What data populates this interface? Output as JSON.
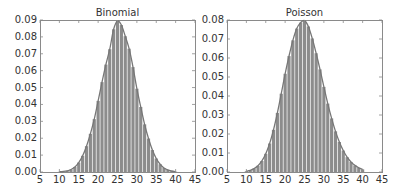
{
  "chart_data": [
    {
      "type": "bar",
      "title": "Binomial",
      "xlabel": "",
      "ylabel": "",
      "xlim": [
        5,
        45
      ],
      "ylim": [
        0,
        0.09
      ],
      "xticks": [
        "5",
        "10",
        "15",
        "20",
        "25",
        "30",
        "35",
        "40",
        "45"
      ],
      "yticks": [
        "0.00",
        "0.01",
        "0.02",
        "0.03",
        "0.04",
        "0.05",
        "0.06",
        "0.07",
        "0.08",
        "0.09"
      ],
      "grid": false,
      "bar_color": "#8c8c8c",
      "line_color": "#777777",
      "categories": [
        10,
        11,
        12,
        13,
        14,
        15,
        16,
        17,
        18,
        19,
        20,
        21,
        22,
        23,
        24,
        25,
        26,
        27,
        28,
        29,
        30,
        31,
        32,
        33,
        34,
        35,
        36,
        37,
        38,
        39,
        40
      ],
      "values": [
        0.0001,
        0.0003,
        0.0007,
        0.0015,
        0.003,
        0.0056,
        0.0096,
        0.0153,
        0.0226,
        0.0313,
        0.0421,
        0.0532,
        0.0636,
        0.0727,
        0.0845,
        0.0894,
        0.087,
        0.0804,
        0.073,
        0.0621,
        0.0493,
        0.0385,
        0.0282,
        0.0198,
        0.013,
        0.008,
        0.0046,
        0.0024,
        0.0012,
        0.0006,
        0.0002
      ],
      "series": [
        {
          "name": "histogram",
          "kind": "bar"
        },
        {
          "name": "theoretical pmf",
          "kind": "line"
        }
      ]
    },
    {
      "type": "bar",
      "title": "Poisson",
      "xlabel": "",
      "ylabel": "",
      "xlim": [
        5,
        45
      ],
      "ylim": [
        0,
        0.08
      ],
      "xticks": [
        "5",
        "10",
        "15",
        "20",
        "25",
        "30",
        "35",
        "40",
        "45"
      ],
      "yticks": [
        "0.00",
        "0.01",
        "0.02",
        "0.03",
        "0.04",
        "0.05",
        "0.06",
        "0.07",
        "0.08"
      ],
      "grid": false,
      "bar_color": "#8c8c8c",
      "line_color": "#777777",
      "categories": [
        10,
        11,
        12,
        13,
        14,
        15,
        16,
        17,
        18,
        19,
        20,
        21,
        22,
        23,
        24,
        25,
        26,
        27,
        28,
        29,
        30,
        31,
        32,
        33,
        34,
        35,
        36,
        37,
        38,
        39,
        40
      ],
      "values": [
        0.0004,
        0.0009,
        0.0018,
        0.0033,
        0.0058,
        0.0096,
        0.015,
        0.0222,
        0.0311,
        0.0412,
        0.0517,
        0.061,
        0.0693,
        0.0755,
        0.0786,
        0.0797,
        0.0766,
        0.0703,
        0.0625,
        0.054,
        0.0448,
        0.036,
        0.0282,
        0.0214,
        0.0158,
        0.0113,
        0.0078,
        0.0053,
        0.0035,
        0.0022,
        0.0014
      ],
      "series": [
        {
          "name": "histogram",
          "kind": "bar"
        },
        {
          "name": "theoretical pmf",
          "kind": "line"
        }
      ]
    }
  ]
}
